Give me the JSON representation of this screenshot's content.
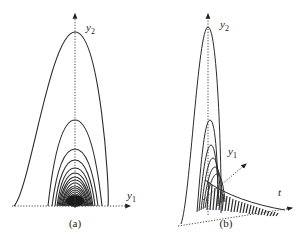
{
  "figure": {
    "panels": [
      {
        "id": "a",
        "caption": "(a)",
        "axes": {
          "vertical": "y",
          "vertical_sub": "2",
          "horizontal": "y",
          "horizontal_sub": "1"
        },
        "description": "Nested parabolic trajectories in the y1-y2 plane converging to the origin"
      },
      {
        "id": "b",
        "caption": "(b)",
        "axes": {
          "vertical": "y",
          "vertical_sub": "2",
          "diagonal": "y",
          "diagonal_sub": "1",
          "time": "t"
        },
        "description": "Same trajectories plotted in 3D with time axis t, decaying over time"
      }
    ],
    "colors": {
      "curve": "#2a2a2a",
      "axis": "#444444",
      "background": "#ffffff"
    }
  }
}
